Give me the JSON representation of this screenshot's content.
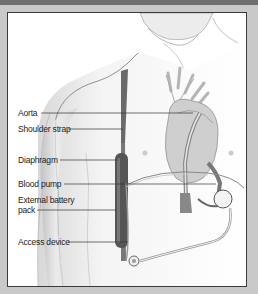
{
  "figure": {
    "labels": [
      {
        "id": "aorta",
        "text": "Aorta"
      },
      {
        "id": "shoulder-strap",
        "text": "Shoulder strap"
      },
      {
        "id": "diaphragm",
        "text": "Diaphragm"
      },
      {
        "id": "blood-pump",
        "text": "Blood pump"
      },
      {
        "id": "external-battery-pack-1",
        "text": "External battery"
      },
      {
        "id": "external-battery-pack-2",
        "text": "pack"
      },
      {
        "id": "access-device",
        "text": "Access device"
      }
    ]
  },
  "colors": {
    "frame": "#c9c9c9",
    "top_band": "#6f6f6f",
    "panel": "#ffffff",
    "border": "#3a3a3a",
    "leader_line": "#333333",
    "strap": "#5a5a5a"
  }
}
